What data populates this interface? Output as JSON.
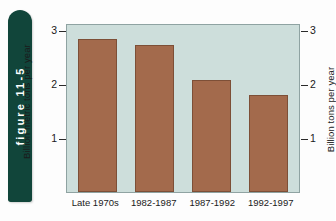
{
  "figure_tab": {
    "label": "figure 11-5"
  },
  "chart_data": {
    "type": "bar",
    "title": "",
    "subtitle": "",
    "xlabel": "",
    "ylabel": "Billion metric tons per year",
    "ylabel_right": "Billion tons per year",
    "categories": [
      "Late 1970s",
      "1982-1987",
      "1987-1992",
      "1992-1997"
    ],
    "values": [
      2.85,
      2.75,
      2.1,
      1.82
    ],
    "series": [
      {
        "name": "Deforestation rate",
        "values": [
          2.85,
          2.75,
          2.1,
          1.82
        ]
      }
    ],
    "ylim": [
      0,
      3.12
    ],
    "yticks": [
      1,
      2,
      3
    ],
    "ytick_labels": [
      "1",
      "2",
      "3"
    ],
    "yticks_right": [
      1,
      2,
      3
    ],
    "ytick_labels_right": [
      "1",
      "2",
      "3"
    ],
    "grid": false,
    "legend": "none",
    "bar_color": "#a36a4c",
    "plot_background": "#cddedb"
  },
  "colors": {
    "tab_green": "#11453a",
    "bar_brown": "#a36a4c",
    "bar_border": "#7d4f37",
    "plot_bg": "#cddedb",
    "text": "#1a1a1a",
    "page_bg": "#fdfdfd"
  }
}
